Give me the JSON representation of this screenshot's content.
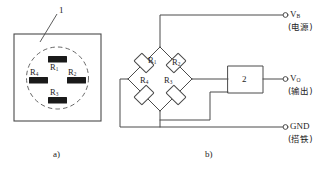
{
  "figure": {
    "captions": {
      "left": "a)",
      "right": "b)"
    },
    "callout": {
      "number": "1"
    }
  },
  "sensor": {
    "gauges": [
      {
        "id": "R1",
        "base": "R",
        "sub": "1",
        "position": "top"
      },
      {
        "id": "R2",
        "base": "R",
        "sub": "2",
        "position": "right"
      },
      {
        "id": "R3",
        "base": "R",
        "sub": "3",
        "position": "bottom"
      },
      {
        "id": "R4",
        "base": "R",
        "sub": "4",
        "position": "left"
      }
    ]
  },
  "bridge": {
    "resistors": [
      {
        "id": "R1",
        "base": "R",
        "sub": "1",
        "arm": "top-left"
      },
      {
        "id": "R2",
        "base": "R",
        "sub": "2",
        "arm": "top-right"
      },
      {
        "id": "R3",
        "base": "R",
        "sub": "3",
        "arm": "bottom-right"
      },
      {
        "id": "R4",
        "base": "R",
        "sub": "4",
        "arm": "bottom-left"
      }
    ],
    "amplifier": {
      "label": "2"
    },
    "terminals": [
      {
        "id": "vb",
        "base": "V",
        "sub": "B",
        "note": "(电源)"
      },
      {
        "id": "vo",
        "base": "V",
        "sub": "O",
        "note": "(输出)"
      },
      {
        "id": "gnd",
        "base": "GND",
        "sub": "",
        "note": "(搭铁)"
      }
    ]
  },
  "colors": {
    "line": "#4a4a4a",
    "gauge_fill": "#1a1a1a",
    "background": "#ffffff"
  }
}
